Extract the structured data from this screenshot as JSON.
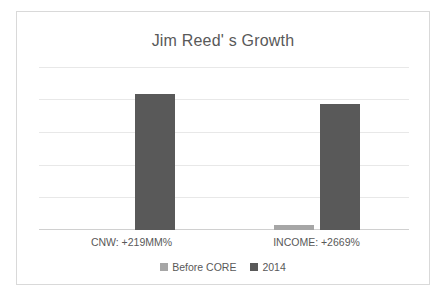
{
  "chart_data": {
    "type": "bar",
    "title": "Jim Reed' s Growth",
    "categories": [
      "CNW: +219MM%",
      "INCOME: +2669%"
    ],
    "series": [
      {
        "name": "Before CORE",
        "values": [
          0,
          4
        ],
        "color": "#a6a6a6"
      },
      {
        "name": "2014",
        "values": [
          100,
          93
        ],
        "color": "#595959"
      }
    ],
    "xlabel": "",
    "ylabel": "",
    "ylim": [
      0,
      120
    ],
    "gridlines": 5,
    "grid": true,
    "legend_position": "bottom",
    "axis_tick_labels": []
  },
  "card": {
    "background": "#ffffff",
    "border_color": "#d9d9d9"
  }
}
